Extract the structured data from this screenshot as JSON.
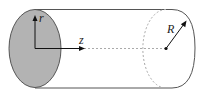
{
  "diagram": {
    "type": "cylinder-coordinates",
    "labels": {
      "radial_axis": "r",
      "axial_axis": "z",
      "radius": "R"
    },
    "colors": {
      "end_face_fill": "#b3b3b3",
      "outline": "#555555",
      "dashed": "#9a9a9a",
      "axes": "#111111"
    }
  }
}
